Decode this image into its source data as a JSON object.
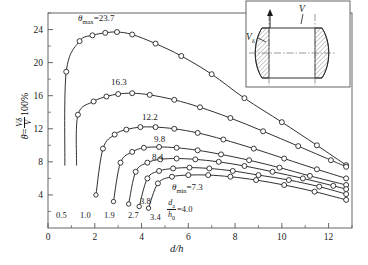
{
  "chart_data": {
    "type": "line",
    "title": "",
    "xlabel": "d/h",
    "ylabel": "θ = (Vδ/V)×100%",
    "xlim": [
      0,
      13
    ],
    "ylim": [
      0,
      26
    ],
    "grid": false,
    "legend_position": "none",
    "x_ticks": [
      "0",
      "2",
      "4",
      "6",
      "8",
      "10",
      "12"
    ],
    "x_tick_values": [
      0,
      2,
      4,
      6,
      8,
      10,
      12
    ],
    "y_ticks": [
      "4",
      "8",
      "12",
      "16",
      "20",
      "24"
    ],
    "y_tick_values": [
      4,
      8,
      12,
      16,
      20,
      24
    ],
    "x_minor_step": 1,
    "y_minor_step": 2,
    "marker": "open-circle",
    "series": [
      {
        "name": "da/h0 = 0.5",
        "peak_label": "θmax=23.7",
        "start_label": "0.5",
        "peak_value": 23.7,
        "x": [
          0.72,
          0.78,
          1.35,
          1.9,
          2.45,
          2.95,
          3.6,
          4.6,
          5.7,
          7.0,
          8.4,
          10.0,
          11.5,
          12.75
        ],
        "y": [
          7.6,
          18.9,
          22.6,
          23.3,
          23.6,
          23.7,
          23.4,
          22.3,
          20.8,
          18.6,
          15.7,
          12.8,
          10.0,
          7.6
        ]
      },
      {
        "name": "da/h0 = 1.0",
        "peak_label": "16.3",
        "start_label": "1.0",
        "peak_value": 16.3,
        "x": [
          1.22,
          1.28,
          1.95,
          2.5,
          3.0,
          3.6,
          4.35,
          5.4,
          6.5,
          7.8,
          9.2,
          10.7,
          12.1,
          12.75
        ],
        "y": [
          7.6,
          13.7,
          15.3,
          15.9,
          16.2,
          16.3,
          16.1,
          15.5,
          14.6,
          13.3,
          11.7,
          9.9,
          8.2,
          7.4
        ]
      },
      {
        "name": "da/h0 = 1.9",
        "peak_label": "12.2",
        "start_label": "1.9",
        "peak_value": 12.2,
        "x": [
          2.05,
          2.35,
          2.85,
          3.35,
          3.95,
          4.6,
          5.4,
          6.4,
          7.5,
          8.8,
          10.1,
          11.5,
          12.75
        ],
        "y": [
          4.0,
          9.6,
          11.3,
          11.9,
          12.2,
          12.2,
          12.0,
          11.5,
          10.7,
          9.6,
          8.4,
          7.1,
          6.0
        ]
      },
      {
        "name": "da/h0 = 2.7",
        "peak_label": "9.8",
        "start_label": "2.7",
        "peak_value": 9.8,
        "x": [
          2.8,
          3.1,
          3.6,
          4.1,
          4.75,
          5.5,
          6.4,
          7.4,
          8.6,
          9.9,
          11.2,
          12.75
        ],
        "y": [
          3.2,
          7.9,
          9.2,
          9.7,
          9.8,
          9.7,
          9.4,
          8.9,
          8.2,
          7.3,
          6.3,
          5.2
        ]
      },
      {
        "name": "da/h0 = 3.4",
        "peak_label": "8.4",
        "start_label": "3.4",
        "peak_value": 8.4,
        "x": [
          3.45,
          3.75,
          4.25,
          4.8,
          5.5,
          6.3,
          7.3,
          8.4,
          9.6,
          10.9,
          12.2,
          12.75
        ],
        "y": [
          2.9,
          6.8,
          7.9,
          8.3,
          8.4,
          8.3,
          8.0,
          7.5,
          6.8,
          6.0,
          5.1,
          4.7
        ]
      },
      {
        "name": "da/h0 = 3.8",
        "peak_label": "θmin=7.3",
        "start_label": "3.8",
        "peak_value": 7.3,
        "x": [
          3.9,
          4.25,
          4.75,
          5.35,
          6.05,
          6.9,
          7.9,
          9.0,
          10.3,
          11.6,
          12.75
        ],
        "y": [
          2.6,
          6.0,
          6.9,
          7.2,
          7.3,
          7.2,
          6.9,
          6.4,
          5.8,
          5.0,
          4.1
        ]
      },
      {
        "name": "da/h0 = 4.0",
        "peak_label": "",
        "start_label": "da/h0=4.0",
        "peak_value": 6.4,
        "x": [
          4.3,
          4.7,
          5.3,
          6.0,
          6.85,
          7.8,
          8.9,
          10.1,
          11.4,
          12.75
        ],
        "y": [
          2.4,
          5.4,
          6.2,
          6.4,
          6.4,
          6.2,
          5.8,
          5.2,
          4.4,
          3.4
        ]
      }
    ],
    "annotations": [
      {
        "text": "θmax=23.7",
        "kind": "curve-peak-label"
      },
      {
        "text": "16.3",
        "kind": "curve-peak-label"
      },
      {
        "text": "12.2",
        "kind": "curve-peak-label"
      },
      {
        "text": "9.8",
        "kind": "curve-peak-label"
      },
      {
        "text": "8.4",
        "kind": "curve-peak-label"
      },
      {
        "text": "θmin=7.3",
        "kind": "curve-peak-label"
      },
      {
        "text": "0.5",
        "kind": "curve-start-label"
      },
      {
        "text": "1.0",
        "kind": "curve-start-label"
      },
      {
        "text": "1.9",
        "kind": "curve-start-label"
      },
      {
        "text": "2.7",
        "kind": "curve-start-label"
      },
      {
        "text": "3.4",
        "kind": "curve-start-label"
      },
      {
        "text": "3.8",
        "kind": "curve-start-label"
      },
      {
        "text": "da/h0=4.0",
        "kind": "curve-start-label"
      }
    ]
  },
  "axes": {
    "y_axis_label": {
      "theta": "θ",
      "equals": "=",
      "numerator": "Vδ",
      "denominator": "V",
      "suffix": "100%"
    },
    "x_axis_label": "d/h",
    "x_ticks": [
      "0",
      "2",
      "4",
      "6",
      "8",
      "10",
      "12"
    ],
    "y_ticks": [
      "4",
      "8",
      "12",
      "16",
      "20",
      "24"
    ]
  },
  "curve_labels": {
    "theta_max": "θmax=23.7",
    "theta_max_sym": "θ",
    "theta_max_sub": "max",
    "theta_max_val": "=23.7",
    "c2": "16.3",
    "c3": "12.2",
    "c4": "9.8",
    "c5": "8.4",
    "theta_min_sym": "θ",
    "theta_min_sub": "min",
    "theta_min_val": "=7.3"
  },
  "start_labels": {
    "s1": "0.5",
    "s2": "1.0",
    "s3": "1.9",
    "s4": "2.7",
    "s5": "3.4",
    "s6": "3.8",
    "ratio_num": "d",
    "ratio_num_sub": "a",
    "ratio_den": "h",
    "ratio_den_sub": "0",
    "ratio_val": "=4.0"
  },
  "inset": {
    "v_label": "V",
    "vdelta_label": "V",
    "vdelta_sub": "δ"
  },
  "colors": {
    "line": "#1a1a1a",
    "axis": "#555555",
    "marker_fill": "#ffffff",
    "hatch": "#6a6a6a",
    "background": "#ffffff"
  }
}
